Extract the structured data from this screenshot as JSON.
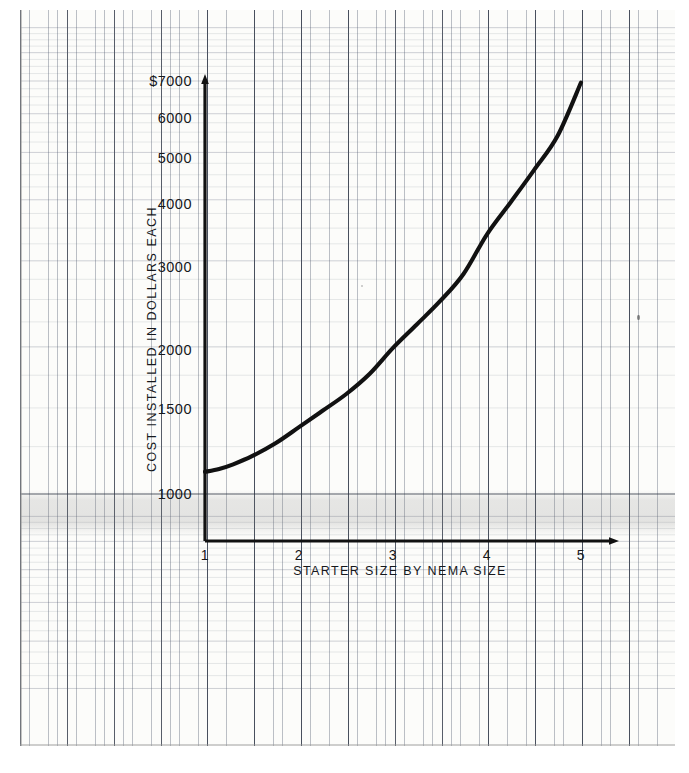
{
  "document": {
    "kind": "semi-log-graph-paper-plot",
    "paper_color": "#fcfcfa",
    "ink_color": "#16181c"
  },
  "chart_data": {
    "type": "line",
    "title": "",
    "xlabel": "STARTER SIZE BY NEMA SIZE",
    "ylabel": "COST INSTALLED IN DOLLARS EACH",
    "x_scale": "linear",
    "y_scale": "log",
    "xlim": [
      1,
      5
    ],
    "ylim": [
      1000,
      7000
    ],
    "grid": true,
    "grid_style": "semi-log graph paper",
    "legend": "none",
    "x_ticks": [
      1,
      2,
      3,
      4,
      5
    ],
    "x_tick_labels": [
      "1",
      "2",
      "3",
      "4",
      "5"
    ],
    "y_ticks": [
      1000,
      1500,
      2000,
      3000,
      4000,
      5000,
      6000,
      7000
    ],
    "y_tick_labels": [
      "1000",
      "1500",
      "2000",
      "3000",
      "4000",
      "5000",
      "6000",
      "$7000"
    ],
    "series": [
      {
        "name": "Installed cost per starter",
        "x": [
          1.0,
          1.15,
          1.3,
          1.5,
          1.75,
          2.0,
          2.25,
          2.5,
          2.75,
          3.0,
          3.25,
          3.5,
          3.75,
          4.0,
          4.25,
          4.5,
          4.75,
          5.0
        ],
        "values": [
          1110,
          1125,
          1150,
          1195,
          1270,
          1370,
          1480,
          1600,
          1760,
          1990,
          2220,
          2480,
          2820,
          3400,
          3950,
          4600,
          5400,
          6950
        ]
      }
    ],
    "annotations": []
  },
  "axis": {
    "y_title": "COST INSTALLED IN DOLLARS EACH",
    "x_title": "STARTER SIZE BY NEMA SIZE",
    "y_labels": [
      "$7000",
      "6000",
      "5000",
      "4000",
      "3000",
      "2000",
      "1500",
      "1000"
    ],
    "x_labels": [
      "1",
      "2",
      "3",
      "4",
      "5"
    ]
  },
  "colors": {
    "curve": "#111111",
    "axis": "#111111",
    "grid_minor": "#5a6272",
    "grid_major": "#2a3040",
    "paper": "#fcfcfa"
  }
}
